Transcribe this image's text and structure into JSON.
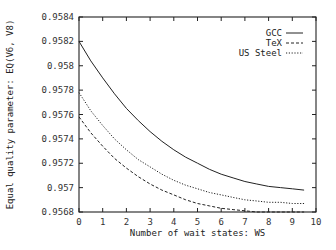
{
  "chart_data": {
    "type": "line",
    "title": "",
    "xlabel": "Number of wait states: WS",
    "ylabel": "Equal quality parameter: EQ(V6, V8)",
    "xlim": [
      0,
      10
    ],
    "ylim": [
      0.9568,
      0.9584
    ],
    "xticks": [
      "0",
      "1",
      "2",
      "3",
      "4",
      "5",
      "6",
      "7",
      "8",
      "9",
      "10"
    ],
    "yticks": [
      "0.9568",
      "0.957",
      "0.9572",
      "0.9574",
      "0.9576",
      "0.9578",
      "0.958",
      "0.9582",
      "0.9584"
    ],
    "grid": false,
    "legend_position": "top-right",
    "x": [
      0,
      0.5,
      1,
      1.5,
      2,
      2.5,
      3,
      3.5,
      4,
      4.5,
      5,
      5.5,
      6,
      6.5,
      7,
      7.5,
      8,
      8.5,
      9,
      9.5
    ],
    "series": [
      {
        "name": "GCC",
        "style": "solid",
        "values": [
          0.9582,
          0.95804,
          0.9579,
          0.95777,
          0.95765,
          0.95755,
          0.95746,
          0.95738,
          0.95731,
          0.95725,
          0.9572,
          0.95715,
          0.95711,
          0.95708,
          0.95705,
          0.95703,
          0.95701,
          0.957,
          0.95699,
          0.95698
        ]
      },
      {
        "name": "TeX",
        "style": "dashed",
        "values": [
          0.95758,
          0.95745,
          0.95734,
          0.95724,
          0.95716,
          0.95709,
          0.95703,
          0.95698,
          0.95694,
          0.9569,
          0.95687,
          0.95685,
          0.95683,
          0.95682,
          0.95681,
          0.9568,
          0.9568,
          0.9568,
          0.9568,
          0.9568
        ]
      },
      {
        "name": "US Steel",
        "style": "dotted",
        "values": [
          0.95778,
          0.95763,
          0.95751,
          0.9574,
          0.95731,
          0.95723,
          0.95717,
          0.95711,
          0.95706,
          0.95702,
          0.95699,
          0.95696,
          0.95694,
          0.95692,
          0.9569,
          0.95689,
          0.95688,
          0.95688,
          0.95687,
          0.95687
        ]
      }
    ]
  }
}
